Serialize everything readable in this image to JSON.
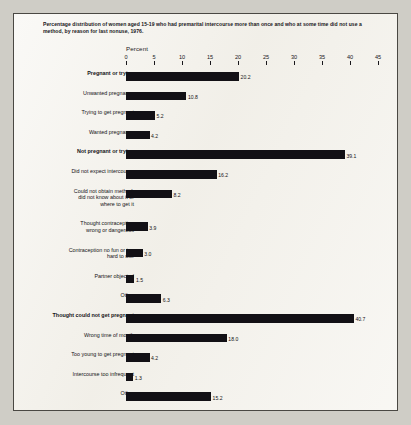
{
  "figure": {
    "title": "Percentage distribution of women aged 15-19 who had premarital intercourse more than once and who at some time did not use a method, by reason for last nonuse, 1976.",
    "axis_title": "Percent"
  },
  "chart_data": {
    "type": "bar",
    "orientation": "horizontal",
    "title": "Percentage distribution of women aged 15-19 who had premarital intercourse more than once and who at some time did not use a method, by reason for last nonuse, 1976.",
    "xlabel": "Percent",
    "ylabel": "",
    "xlim": [
      0,
      45
    ],
    "grid": false,
    "legend": "none",
    "tick_labels": [
      "0",
      "5",
      "10",
      "15",
      "20",
      "25",
      "30",
      "35",
      "40",
      "45"
    ],
    "tick_values": [
      0,
      5,
      10,
      15,
      20,
      25,
      30,
      35,
      40,
      45
    ],
    "bar_color": "#121015",
    "categories": [
      "Pregnant or trying",
      "Unwanted pregnancy",
      "Trying to get pregnant",
      "Wanted pregnancy",
      "Not pregnant or trying",
      "Did not expect intercourse",
      "Could not obtain method; did not know about it or where to get it",
      "Thought contraception wrong or dangerous",
      "Contraception no fun or too hard to use",
      "Partner objected",
      "Other",
      "Thought could not get pregnant",
      "Wrong time of month",
      "Too young to get pregnant",
      "Intercourse too infrequent",
      "Other"
    ],
    "values": [
      20.2,
      10.8,
      5.2,
      4.2,
      39.1,
      16.2,
      8.2,
      3.9,
      3.0,
      1.5,
      6.3,
      40.7,
      18.0,
      4.2,
      1.3,
      15.2
    ]
  },
  "rows": [
    {
      "lines": [
        "Pregnant or trying"
      ],
      "value": 20.2,
      "value_label": "20.2",
      "group": true
    },
    {
      "lines": [
        "Unwanted pregnancy"
      ],
      "value": 10.8,
      "value_label": "10.8",
      "group": false
    },
    {
      "lines": [
        "Trying to get pregnant"
      ],
      "value": 5.2,
      "value_label": "5.2",
      "group": false
    },
    {
      "lines": [
        "Wanted pregnancy"
      ],
      "value": 4.2,
      "value_label": "4.2",
      "group": false
    },
    {
      "lines": [
        "Not pregnant or trying"
      ],
      "value": 39.1,
      "value_label": "39.1",
      "group": true
    },
    {
      "lines": [
        "Did not expect intercourse"
      ],
      "value": 16.2,
      "value_label": "16.2",
      "group": false
    },
    {
      "lines": [
        "Could not obtain method;",
        "did not know about it or",
        "where to get it"
      ],
      "value": 8.2,
      "value_label": "8.2",
      "group": false
    },
    {
      "lines": [
        "Thought contraception",
        "wrong or dangerous"
      ],
      "value": 3.9,
      "value_label": "3.9",
      "group": false
    },
    {
      "lines": [
        "Contraception no fun or too",
        "hard to use"
      ],
      "value": 3.0,
      "value_label": "3.0",
      "group": false
    },
    {
      "lines": [
        "Partner objected"
      ],
      "value": 1.5,
      "value_label": "1.5",
      "group": false
    },
    {
      "lines": [
        "Other"
      ],
      "value": 6.3,
      "value_label": "6.3",
      "group": false
    },
    {
      "lines": [
        "Thought could not get pregnant"
      ],
      "value": 40.7,
      "value_label": "40.7",
      "group": true
    },
    {
      "lines": [
        "Wrong time of month"
      ],
      "value": 18.0,
      "value_label": "18.0",
      "group": false
    },
    {
      "lines": [
        "Too young to get pregnant"
      ],
      "value": 4.2,
      "value_label": "4.2",
      "group": false
    },
    {
      "lines": [
        "Intercourse too infrequent"
      ],
      "value": 1.3,
      "value_label": "1.3",
      "group": false
    },
    {
      "lines": [
        "Other"
      ],
      "value": 15.2,
      "value_label": "15.2",
      "group": false
    }
  ]
}
